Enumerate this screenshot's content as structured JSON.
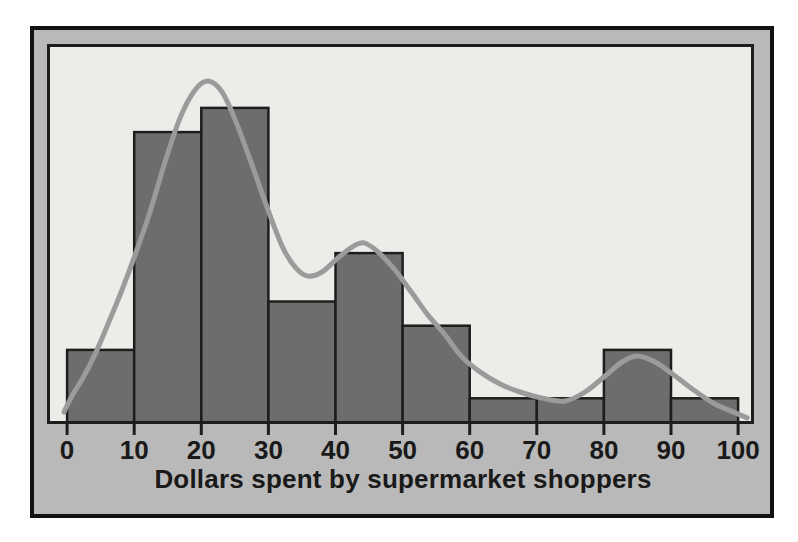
{
  "chart_data": {
    "type": "bar",
    "subtype": "histogram",
    "title": "",
    "xlabel": "Dollars spent by supermarket shoppers",
    "ylabel": "",
    "grid": false,
    "legend": null,
    "xlim": [
      0,
      100
    ],
    "ylim": [
      0,
      15.6
    ],
    "bin_edges": [
      0,
      10,
      20,
      30,
      40,
      50,
      60,
      70,
      80,
      90,
      100
    ],
    "counts": [
      3,
      12,
      13,
      5,
      7,
      4,
      1,
      1,
      3,
      1
    ],
    "x_ticks": [
      0,
      10,
      20,
      30,
      40,
      50,
      60,
      70,
      80,
      90,
      100
    ],
    "x_tick_labels": [
      "0",
      "10",
      "20",
      "30",
      "40",
      "50",
      "60",
      "70",
      "80",
      "90",
      "100"
    ],
    "overlay_curve": {
      "name": "density-curve",
      "points": [
        [
          -0.46,
          0.43
        ],
        [
          0.73,
          1.1
        ],
        [
          2.52,
          1.92
        ],
        [
          4.31,
          2.91
        ],
        [
          6.1,
          4.07
        ],
        [
          7.88,
          5.27
        ],
        [
          9.97,
          6.8
        ],
        [
          12.35,
          8.7
        ],
        [
          14.59,
          10.76
        ],
        [
          16.83,
          12.58
        ],
        [
          19.06,
          13.74
        ],
        [
          21.0,
          14.11
        ],
        [
          23.09,
          13.66
        ],
        [
          25.17,
          12.42
        ],
        [
          27.56,
          10.64
        ],
        [
          29.94,
          8.78
        ],
        [
          32.18,
          7.21
        ],
        [
          34.11,
          6.38
        ],
        [
          35.9,
          6.05
        ],
        [
          37.99,
          6.22
        ],
        [
          40.37,
          6.8
        ],
        [
          42.46,
          7.25
        ],
        [
          44.25,
          7.42
        ],
        [
          46.33,
          7.05
        ],
        [
          48.87,
          6.3
        ],
        [
          51.4,
          5.35
        ],
        [
          53.79,
          4.44
        ],
        [
          56.32,
          3.62
        ],
        [
          58.85,
          2.71
        ],
        [
          61.54,
          2.09
        ],
        [
          64.52,
          1.59
        ],
        [
          67.5,
          1.26
        ],
        [
          70.78,
          1.01
        ],
        [
          74.21,
          0.89
        ],
        [
          77.19,
          1.26
        ],
        [
          80.18,
          1.92
        ],
        [
          82.71,
          2.5
        ],
        [
          84.95,
          2.75
        ],
        [
          87.63,
          2.5
        ],
        [
          90.61,
          1.92
        ],
        [
          93.59,
          1.3
        ],
        [
          96.57,
          0.76
        ],
        [
          99.7,
          0.39
        ],
        [
          101.34,
          0.19
        ]
      ]
    },
    "colors": {
      "page_bg": "#ffffff",
      "panel_bg": "#b9b9b9",
      "frame_border": "#121212",
      "plot_bg": "#ecece9",
      "plot_border": "#1d1d1d",
      "bar_fill": "#6d6d6d",
      "bar_stroke": "#1d1d1d",
      "curve": "#9b9b9b",
      "text": "#1a1a1a"
    }
  }
}
